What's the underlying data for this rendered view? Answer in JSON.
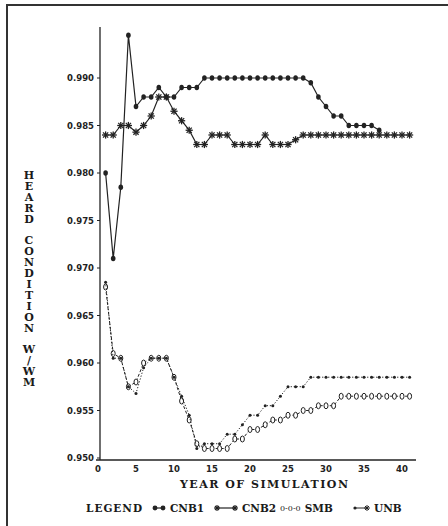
{
  "chart_data": {
    "type": "line",
    "title": "",
    "xlabel": "YEAR OF SIMULATION",
    "ylabel": "HEARD CONDITION W/WM",
    "xlim": [
      0,
      42
    ],
    "ylim": [
      0.95,
      0.995
    ],
    "x_ticks": [
      0,
      5,
      10,
      15,
      20,
      25,
      30,
      35,
      40
    ],
    "x_tick_labels": [
      "0",
      "5",
      "10",
      "15",
      "20",
      "25",
      "30",
      "35",
      "40"
    ],
    "y_ticks": [
      0.95,
      0.955,
      0.96,
      0.965,
      0.97,
      0.975,
      0.98,
      0.985,
      0.99
    ],
    "y_tick_labels": [
      "0.950",
      "0.955",
      "0.960",
      "0.965",
      "0.970",
      "0.975",
      "0.980",
      "0.985",
      "0.990"
    ],
    "grid": false,
    "legend_position": "bottom",
    "series": [
      {
        "name": "CNB1",
        "marker": "filled-dot",
        "line": "solid",
        "x": [
          1,
          2,
          3,
          4,
          5,
          6,
          7,
          8,
          9,
          10,
          11,
          12,
          13,
          14,
          15,
          16,
          17,
          18,
          19,
          20,
          21,
          22,
          23,
          24,
          25,
          26,
          27,
          28,
          29,
          30,
          31,
          32,
          33,
          34,
          35,
          36,
          37
        ],
        "values": [
          0.98,
          0.971,
          0.9785,
          0.9945,
          0.987,
          0.988,
          0.988,
          0.989,
          0.988,
          0.988,
          0.989,
          0.989,
          0.989,
          0.99,
          0.99,
          0.99,
          0.99,
          0.99,
          0.99,
          0.99,
          0.99,
          0.99,
          0.99,
          0.99,
          0.99,
          0.99,
          0.99,
          0.9895,
          0.988,
          0.987,
          0.986,
          0.986,
          0.985,
          0.985,
          0.985,
          0.985,
          0.9845
        ]
      },
      {
        "name": "CNB2",
        "marker": "star",
        "line": "solid",
        "x": [
          1,
          2,
          3,
          4,
          5,
          6,
          7,
          8,
          9,
          10,
          11,
          12,
          13,
          14,
          15,
          16,
          17,
          18,
          19,
          20,
          21,
          22,
          23,
          24,
          25,
          26,
          27,
          28,
          29,
          30,
          31,
          32,
          33,
          34,
          35,
          36,
          37,
          38,
          39,
          40,
          41
        ],
        "values": [
          0.984,
          0.984,
          0.985,
          0.985,
          0.9843,
          0.985,
          0.986,
          0.988,
          0.988,
          0.9865,
          0.9855,
          0.9845,
          0.983,
          0.983,
          0.984,
          0.984,
          0.984,
          0.983,
          0.983,
          0.983,
          0.983,
          0.984,
          0.983,
          0.983,
          0.983,
          0.9835,
          0.984,
          0.984,
          0.984,
          0.984,
          0.984,
          0.984,
          0.984,
          0.984,
          0.984,
          0.984,
          0.984,
          0.984,
          0.984,
          0.984,
          0.984
        ]
      },
      {
        "name": "SMB",
        "marker": "open-circle",
        "line": "dashed",
        "x": [
          1,
          2,
          3,
          4,
          5,
          6,
          7,
          8,
          9,
          10,
          11,
          12,
          13,
          14,
          15,
          16,
          17,
          18,
          19,
          20,
          21,
          22,
          23,
          24,
          25,
          26,
          27,
          28,
          29,
          30,
          31,
          32,
          33,
          34,
          35,
          36,
          37,
          38,
          39,
          40,
          41
        ],
        "values": [
          0.968,
          0.961,
          0.9605,
          0.9575,
          0.958,
          0.96,
          0.9605,
          0.9605,
          0.9605,
          0.9585,
          0.956,
          0.954,
          0.9515,
          0.951,
          0.951,
          0.951,
          0.951,
          0.952,
          0.952,
          0.953,
          0.953,
          0.9535,
          0.954,
          0.954,
          0.9545,
          0.9545,
          0.955,
          0.955,
          0.9555,
          0.9555,
          0.9555,
          0.9565,
          0.9565,
          0.9565,
          0.9565,
          0.9565,
          0.9565,
          0.9565,
          0.9565,
          0.9565,
          0.9565
        ]
      },
      {
        "name": "UNB",
        "marker": "small-star",
        "line": "dotted",
        "x": [
          1,
          2,
          3,
          4,
          5,
          6,
          7,
          8,
          9,
          10,
          11,
          12,
          13,
          14,
          15,
          16,
          17,
          18,
          19,
          20,
          21,
          22,
          23,
          24,
          25,
          26,
          27,
          28,
          29,
          30,
          31,
          32,
          33,
          34,
          35,
          36,
          37,
          38,
          39,
          40,
          41
        ],
        "values": [
          0.9685,
          0.9605,
          0.9605,
          0.9575,
          0.9568,
          0.9595,
          0.9605,
          0.9605,
          0.9605,
          0.9585,
          0.9565,
          0.9545,
          0.951,
          0.9515,
          0.9515,
          0.9515,
          0.9525,
          0.9525,
          0.9535,
          0.9545,
          0.9545,
          0.9555,
          0.9555,
          0.9565,
          0.9575,
          0.9575,
          0.9575,
          0.9585,
          0.9585,
          0.9585,
          0.9585,
          0.9585,
          0.9585,
          0.9585,
          0.9585,
          0.9585,
          0.9585,
          0.9585,
          0.9585,
          0.9585,
          0.9585
        ]
      }
    ]
  },
  "labels": {
    "ylabel_letters": [
      "H",
      "E",
      "A",
      "R",
      "D",
      " ",
      "C",
      "O",
      "N",
      "D",
      "I",
      "T",
      "I",
      "O",
      "N",
      " ",
      "W",
      "/",
      "W",
      "M"
    ],
    "xlabel": "YEAR OF SIMULATION",
    "legend_title": "LEGEND",
    "legend_items": [
      "CNB1",
      "CNB2",
      "SMB",
      "UNB"
    ],
    "legend_smb_glyph": "0-0-0"
  }
}
